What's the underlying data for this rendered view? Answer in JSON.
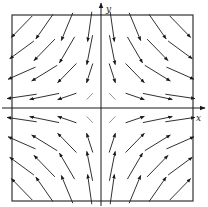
{
  "diagram": {
    "type": "vector_field",
    "field": {
      "u": "x",
      "v": "-y"
    },
    "axes": {
      "x_label": "x",
      "y_label": "y"
    },
    "grid": {
      "x_samples": [
        -3.5,
        -2.5,
        -1.5,
        -0.5,
        0.5,
        1.5,
        2.5,
        3.5
      ],
      "y_samples": [
        3.5,
        2.5,
        1.5,
        0.5,
        -0.5,
        -1.5,
        -2.5,
        -3.5
      ]
    },
    "domain": {
      "x": [
        -4,
        4
      ],
      "y": [
        -4,
        4
      ]
    },
    "colors": {
      "ink": "#1a1a1a",
      "frame": "#333333",
      "background": "#ffffff"
    }
  }
}
